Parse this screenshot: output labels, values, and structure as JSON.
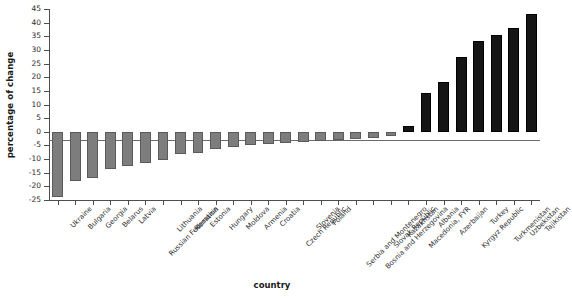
{
  "chart_data": {
    "type": "bar",
    "title": "",
    "xlabel": "country",
    "ylabel": "percentage of change",
    "ylim": [
      -25,
      45
    ],
    "ytick_labels": [
      "45",
      "40",
      "35",
      "30",
      "25",
      "20",
      "15",
      "10",
      "5",
      "0",
      "-5",
      "-10",
      "-15",
      "-20",
      "-25"
    ],
    "yticks": [
      45,
      40,
      35,
      30,
      25,
      20,
      15,
      10,
      5,
      0,
      -5,
      -10,
      -15,
      -20,
      -25
    ],
    "grid": false,
    "legend": null,
    "bar_colors": {
      "negative": "#7d7d7d",
      "positive": "#151515"
    },
    "categories": [
      "Ukraine",
      "Bulgaria",
      "Georgia",
      "Belarus",
      "Latvia",
      "Russian Federation",
      "Lithuania",
      "Romania",
      "Estonia",
      "Hungary",
      "Moldova",
      "Armenia",
      "Croatia",
      "Czech Republic",
      "Slovenia",
      "Poland",
      "Serbia and Montenegro",
      "Bosnia and Herzegovina",
      "Slovak Republic",
      "Kazakhstan",
      "Macedonia, FYR",
      "Albania",
      "Azerbaijan",
      "Kyrgyz Republic",
      "Turkey",
      "Turkmenistan",
      "Uzbekistan",
      "Tajikistan"
    ],
    "values": [
      -24.0,
      -18.2,
      -17.1,
      -13.7,
      -12.5,
      -11.5,
      -10.3,
      -8.0,
      -7.8,
      -6.3,
      -5.6,
      -4.8,
      -4.6,
      -4.2,
      -3.8,
      -3.3,
      -3.0,
      -2.6,
      -2.1,
      -1.5,
      2.1,
      14.3,
      18.2,
      27.3,
      33.3,
      35.5,
      38.2,
      43.3
    ]
  }
}
